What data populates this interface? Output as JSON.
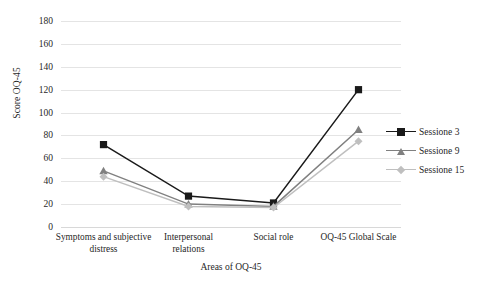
{
  "chart_data": {
    "type": "line",
    "title": "",
    "xlabel": "Areas of OQ-45",
    "ylabel": "Score OQ-45",
    "ylim": [
      0,
      180
    ],
    "ytick_step": 20,
    "yticks": [
      0,
      20,
      40,
      60,
      80,
      100,
      120,
      140,
      160,
      180
    ],
    "grid": true,
    "legend_position": "right",
    "categories": [
      "Symptoms and subjective distress",
      "Interpersonal relations",
      "Social role",
      "OQ-45 Global Scale"
    ],
    "category_lines": [
      [
        "Symptoms and subjective",
        "distress"
      ],
      [
        "Interpersonal",
        "relations"
      ],
      [
        "Social role"
      ],
      [
        "OQ-45 Global Scale"
      ]
    ],
    "series": [
      {
        "name": "Sessione 3",
        "values": [
          72,
          27,
          21,
          120
        ],
        "color": "#1a1a1a",
        "marker": "square"
      },
      {
        "name": "Sessione 9",
        "values": [
          49,
          20,
          18,
          85
        ],
        "color": "#808080",
        "marker": "triangle"
      },
      {
        "name": "Sessione 15",
        "values": [
          44,
          18,
          17,
          75
        ],
        "color": "#bfbfbf",
        "marker": "diamond"
      }
    ]
  },
  "legend": {
    "items": [
      {
        "label": "Sessione 3"
      },
      {
        "label": "Sessione 9"
      },
      {
        "label": "Sessione 15"
      }
    ]
  }
}
